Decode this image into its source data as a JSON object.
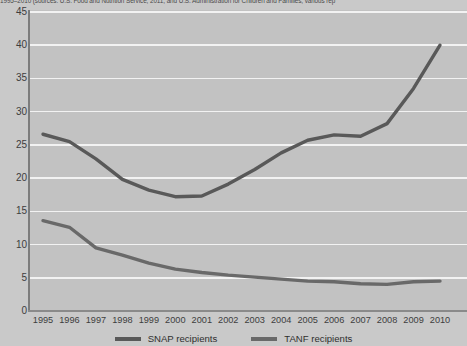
{
  "caption": {
    "text": "1995–2010 (sources: U.S. Food and Nutrition Service, 2011, and U.S. Administration for Children and Families, various rep"
  },
  "chart_data": {
    "type": "line",
    "title": "",
    "subtitle": "",
    "xlabel": "",
    "ylabel": "",
    "categories": [
      "1995",
      "1996",
      "1997",
      "1998",
      "1999",
      "2000",
      "2001",
      "2002",
      "2003",
      "2004",
      "2005",
      "2006",
      "2007",
      "2008",
      "2009",
      "2010"
    ],
    "x": [
      1995,
      1996,
      1997,
      1998,
      1999,
      2000,
      2001,
      2002,
      2003,
      2004,
      2005,
      2006,
      2007,
      2008,
      2009,
      2010
    ],
    "series": [
      {
        "name": "SNAP recipients",
        "color": "#595959",
        "values": [
          26.6,
          25.5,
          22.9,
          19.8,
          18.2,
          17.2,
          17.3,
          19.1,
          21.3,
          23.8,
          25.7,
          26.5,
          26.3,
          28.2,
          33.5,
          40.0
        ]
      },
      {
        "name": "TANF recipients",
        "color": "#696969",
        "values": [
          13.6,
          12.6,
          9.5,
          8.4,
          7.2,
          6.3,
          5.8,
          5.4,
          5.1,
          4.8,
          4.5,
          4.4,
          4.1,
          4.0,
          4.4,
          4.5
        ]
      }
    ],
    "ylim": [
      0,
      45
    ],
    "yticks": [
      0,
      5,
      10,
      15,
      20,
      25,
      30,
      35,
      40,
      45
    ],
    "grid": true,
    "legend_position": "bottom",
    "legend": [
      "SNAP recipients",
      "TANF recipients"
    ],
    "colors": {
      "plot_background": "#c2c2c2",
      "page_background": "#c9c9c9",
      "gridline": "#f2f2f2",
      "axis": "#7c7c7c",
      "tick_text": "#3d3d3d"
    }
  }
}
